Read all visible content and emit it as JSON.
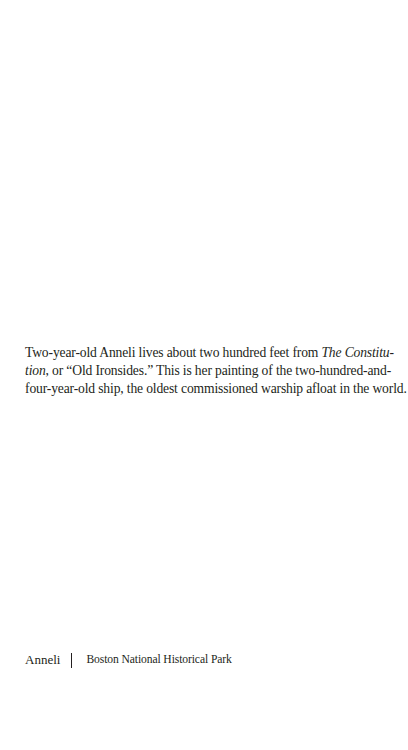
{
  "page": {
    "background": "#ffffff",
    "text_color": "#231f20"
  },
  "caption": {
    "line1_pre": "Two-year-old Anneli lives about two hundred feet from ",
    "line1_italic": "The Constitu-",
    "line2_italic": "tion",
    "line2_post": ", or “Old Ironsides.” This is her painting of the two-hundred-and-",
    "line3": "four-year-old ship, the oldest commissioned warship afloat in the world."
  },
  "footer": {
    "artist": "Anneli",
    "location": "Boston National Historical Park"
  }
}
